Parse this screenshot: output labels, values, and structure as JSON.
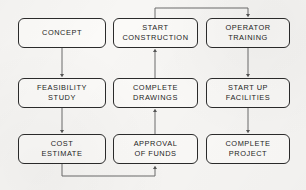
{
  "diagram": {
    "type": "flowchart",
    "background_color": "#f7f6f4",
    "stroke_color": "#2b2b2b",
    "connector_color": "#555555",
    "node_fill": "#fbfaf8",
    "nodes": [
      {
        "id": "concept",
        "label": "CONCEPT",
        "column": 1,
        "row": 1,
        "x": 18,
        "y": 18,
        "w": 88,
        "h": 30
      },
      {
        "id": "start-construction",
        "label": "START\nCONSTRUCTION",
        "column": 2,
        "row": 1,
        "x": 113,
        "y": 18,
        "w": 85,
        "h": 30
      },
      {
        "id": "operator-training",
        "label": "OPERATOR\nTRAINING",
        "column": 3,
        "row": 1,
        "x": 206,
        "y": 18,
        "w": 84,
        "h": 30
      },
      {
        "id": "feasibility-study",
        "label": "FEASIBILITY\nSTUDY",
        "column": 1,
        "row": 2,
        "x": 18,
        "y": 78,
        "w": 88,
        "h": 30
      },
      {
        "id": "complete-drawings",
        "label": "COMPLETE\nDRAWINGS",
        "column": 2,
        "row": 2,
        "x": 113,
        "y": 78,
        "w": 85,
        "h": 30
      },
      {
        "id": "start-up-facilities",
        "label": "START  UP\nFACILITIES",
        "column": 3,
        "row": 2,
        "x": 206,
        "y": 78,
        "w": 84,
        "h": 30
      },
      {
        "id": "cost-estimate",
        "label": "COST\nESTIMATE",
        "column": 1,
        "row": 3,
        "x": 18,
        "y": 134,
        "w": 88,
        "h": 30
      },
      {
        "id": "approval-of-funds",
        "label": "APPROVAL\nOF  FUNDS",
        "column": 2,
        "row": 3,
        "x": 113,
        "y": 134,
        "w": 85,
        "h": 30
      },
      {
        "id": "complete-project",
        "label": "COMPLETE\nPROJECT",
        "column": 3,
        "row": 3,
        "x": 206,
        "y": 134,
        "w": 84,
        "h": 30
      }
    ],
    "edges": [
      {
        "id": "edge-concept-to-feasibility",
        "from": "concept",
        "to": "feasibility-study",
        "kind": "vertical"
      },
      {
        "id": "edge-feasibility-to-cost",
        "from": "feasibility-study",
        "to": "cost-estimate",
        "kind": "vertical"
      },
      {
        "id": "edge-cost-to-approval",
        "from": "cost-estimate",
        "to": "approval-of-funds",
        "kind": "elbow-bottom"
      },
      {
        "id": "edge-approval-to-drawings",
        "from": "approval-of-funds",
        "to": "complete-drawings",
        "kind": "vertical-up"
      },
      {
        "id": "edge-drawings-to-start-construction",
        "from": "complete-drawings",
        "to": "start-construction",
        "kind": "vertical-up"
      },
      {
        "id": "edge-construction-to-operator",
        "from": "start-construction",
        "to": "operator-training",
        "kind": "elbow-top"
      },
      {
        "id": "edge-operator-to-startup",
        "from": "operator-training",
        "to": "start-up-facilities",
        "kind": "vertical"
      },
      {
        "id": "edge-startup-to-complete-project",
        "from": "start-up-facilities",
        "to": "complete-project",
        "kind": "vertical"
      }
    ]
  }
}
